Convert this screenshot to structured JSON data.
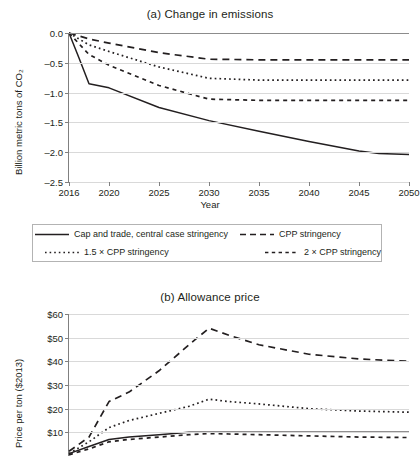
{
  "figure": {
    "background": "#ffffff",
    "line_color": "#231f20",
    "grid_color": "#d9d9d9"
  },
  "panel_a": {
    "title": "(a) Change in emissions",
    "ylabel": "Billion metric tons of CO₂",
    "xlabel": "Year",
    "yticks": [
      "0.0",
      "–0.5",
      "–1.0",
      "–1.5",
      "–2.0",
      "–2.5"
    ],
    "xticks": [
      "2016",
      "2020",
      "2025",
      "2030",
      "2035",
      "2040",
      "2045",
      "2050"
    ]
  },
  "panel_b": {
    "title": "(b) Allowance price",
    "ylabel": "Price per ton ($2013)",
    "yticks": [
      "$60",
      "$50",
      "$40",
      "$30",
      "$20",
      "$10"
    ]
  },
  "legend": {
    "items": [
      {
        "label": "Cap and trade, central case stringency",
        "style": "solid"
      },
      {
        "label": "CPP stringency",
        "style": "long-dash"
      },
      {
        "label": "1.5 × CPP stringency",
        "style": "dotted"
      },
      {
        "label": "2 × CPP stringency",
        "style": "dash"
      }
    ]
  },
  "chart_data": [
    {
      "type": "line",
      "title": "(a) Change in emissions",
      "xlabel": "Year",
      "ylabel": "Billion metric tons of CO2",
      "xlim": [
        2016,
        2050
      ],
      "ylim": [
        -2.5,
        0.0
      ],
      "xticks": [
        2016,
        2020,
        2025,
        2030,
        2035,
        2040,
        2045,
        2050
      ],
      "yticks": [
        0.0,
        -0.5,
        -1.0,
        -1.5,
        -2.0,
        -2.5
      ],
      "grid": true,
      "legend": "below",
      "x": [
        2016,
        2017,
        2018,
        2020,
        2025,
        2030,
        2035,
        2040,
        2045,
        2047,
        2050
      ],
      "series": [
        {
          "name": "Cap and trade, central case stringency",
          "style": "solid",
          "values": [
            0.0,
            -0.42,
            -0.85,
            -0.92,
            -1.25,
            -1.47,
            -1.65,
            -1.82,
            -1.98,
            -2.02,
            -2.04
          ]
        },
        {
          "name": "CPP stringency",
          "style": "long-dash",
          "values": [
            0.0,
            -0.05,
            -0.1,
            -0.17,
            -0.33,
            -0.44,
            -0.45,
            -0.45,
            -0.45,
            -0.45,
            -0.45
          ]
        },
        {
          "name": "1.5 × CPP stringency",
          "style": "dotted",
          "values": [
            0.0,
            -0.1,
            -0.2,
            -0.31,
            -0.57,
            -0.76,
            -0.79,
            -0.79,
            -0.79,
            -0.79,
            -0.79
          ]
        },
        {
          "name": "2 × CPP stringency",
          "style": "dash",
          "values": [
            0.0,
            -0.18,
            -0.36,
            -0.54,
            -0.88,
            -1.11,
            -1.13,
            -1.13,
            -1.13,
            -1.13,
            -1.13
          ]
        }
      ]
    },
    {
      "type": "line",
      "title": "(b) Allowance price",
      "xlabel": "Year",
      "ylabel": "Price per ton ($2013)",
      "xlim": [
        2016,
        2050
      ],
      "ylim": [
        0,
        60
      ],
      "yticks": [
        60,
        50,
        40,
        30,
        20,
        10
      ],
      "grid": true,
      "note": "Lower portion of panel (b) is cut off by the screenshot edge.",
      "x": [
        2016,
        2018,
        2020,
        2022,
        2025,
        2028,
        2030,
        2032,
        2035,
        2040,
        2045,
        2050
      ],
      "series": [
        {
          "name": "CPP stringency",
          "style": "long-dash",
          "values": [
            2,
            8,
            23,
            27,
            36,
            47,
            54,
            51,
            47,
            43,
            41,
            40
          ]
        },
        {
          "name": "1.5 × CPP stringency",
          "style": "dotted",
          "values": [
            1,
            6,
            12,
            15,
            18,
            21,
            24,
            23,
            22,
            20,
            19,
            18.5
          ]
        },
        {
          "name": "2 × CPP stringency",
          "style": "dash",
          "values": [
            0.5,
            3,
            6,
            7,
            8,
            9,
            9.5,
            9.3,
            9,
            8.5,
            8,
            7.8
          ]
        },
        {
          "name": "Cap and trade, central case stringency",
          "style": "solid",
          "values": [
            1,
            4,
            7,
            8,
            9,
            10,
            10,
            10,
            10,
            10,
            10,
            10
          ]
        }
      ]
    }
  ]
}
